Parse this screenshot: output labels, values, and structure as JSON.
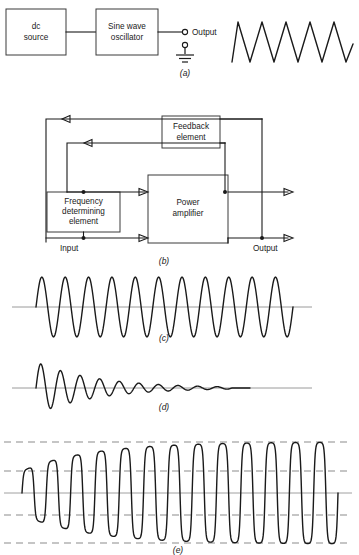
{
  "figure": {
    "background_color": "#ffffff",
    "line_color": "#1a1a1a",
    "guide_color": "#8c8c8c",
    "width": 359,
    "height": 555
  },
  "panels": [
    {
      "id": "a",
      "caption": "(a)",
      "type": "block-diagram-with-waveform",
      "blocks": [
        {
          "name": "dc-source",
          "label_line1": "dc",
          "label_line2": "source"
        },
        {
          "name": "sine-wave-oscillator",
          "label_line1": "Sine wave",
          "label_line2": "oscillator"
        }
      ],
      "terminals": [
        {
          "name": "output-terminal",
          "label": "Output"
        },
        {
          "name": "ground-terminal",
          "label": ""
        }
      ],
      "waveform": {
        "name": "sine-wave-output",
        "type": "sine",
        "cycles": 5,
        "amplitude": "constant",
        "description": "Continuous constant-amplitude sine wave"
      }
    },
    {
      "id": "b",
      "caption": "(b)",
      "type": "feedback-block-diagram",
      "blocks": [
        {
          "name": "feedback-element",
          "label_line1": "Feedback",
          "label_line2": "element"
        },
        {
          "name": "frequency-determining-element",
          "label_line1": "Frequency",
          "label_line2": "determining",
          "label_line3": "element"
        },
        {
          "name": "power-amplifier",
          "label_line1": "Power",
          "label_line2": "amplifier"
        }
      ],
      "labels": [
        {
          "name": "input-label",
          "text": "Input"
        },
        {
          "name": "output-label",
          "text": "Output"
        }
      ]
    },
    {
      "id": "c",
      "caption": "(c)",
      "type": "waveform",
      "waveform": {
        "name": "constant-amplitude-oscillation",
        "type": "sine",
        "cycles": 11,
        "amplitude": "constant",
        "description": "Sustained constant-amplitude oscillation about baseline"
      }
    },
    {
      "id": "d",
      "caption": "(d)",
      "type": "waveform",
      "waveform": {
        "name": "damped-oscillation",
        "type": "damped-sine",
        "cycles": 10,
        "amplitude": "decaying",
        "description": "Damped oscillation decaying to zero"
      }
    },
    {
      "id": "e",
      "caption": "(e)",
      "type": "waveform",
      "waveform": {
        "name": "growing-oscillation-with-limiting",
        "type": "growing-sine-clipped",
        "cycles": 13,
        "amplitude": "growing-then-saturated",
        "description": "Build-up oscillation growing to a limited (clipped) steady amplitude",
        "guide_lines": 5
      }
    }
  ],
  "chart_data": {
    "type": "line",
    "xlabel": "Time",
    "ylabel": "Amplitude",
    "series": [
      {
        "name": "(a) sine wave output",
        "cycles": 5,
        "envelope": "constant"
      },
      {
        "name": "(c) sustained oscillation",
        "cycles": 11,
        "envelope": "constant"
      },
      {
        "name": "(d) damped oscillation",
        "cycles": 10,
        "envelope": "exponential-decay"
      },
      {
        "name": "(e) building oscillation",
        "cycles": 13,
        "envelope": "exponential-rise-limited"
      }
    ]
  }
}
